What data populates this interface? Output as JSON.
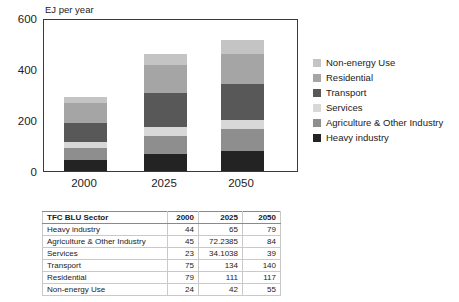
{
  "chart_data": {
    "type": "bar",
    "stacked": true,
    "ylabel": "EJ per year",
    "categories": [
      "2000",
      "2025",
      "2050"
    ],
    "series": [
      {
        "name": "Heavy industry",
        "color": "#232323",
        "values": [
          44,
          65,
          79
        ]
      },
      {
        "name": "Agriculture & Other Industry",
        "color": "#8e8e8e",
        "values": [
          45,
          72.2385,
          84
        ]
      },
      {
        "name": "Services",
        "color": "#d8d8d8",
        "values": [
          23,
          34.1038,
          39
        ]
      },
      {
        "name": "Transport",
        "color": "#585858",
        "values": [
          75,
          134,
          140
        ]
      },
      {
        "name": "Residential",
        "color": "#a5a5a5",
        "values": [
          79,
          111,
          117
        ]
      },
      {
        "name": "Non-energy Use",
        "color": "#c4c4c4",
        "values": [
          24,
          42,
          55
        ]
      }
    ],
    "legend_order": [
      "Non-energy Use",
      "Residential",
      "Transport",
      "Services",
      "Agriculture & Other Industry",
      "Heavy industry"
    ],
    "legend_position": "right",
    "ylim": [
      0,
      600
    ],
    "yticks": [
      0,
      200,
      400,
      600
    ],
    "grid": false
  },
  "table": {
    "headers": [
      "TFC BLU Sector",
      "2000",
      "2025",
      "2050"
    ],
    "rows": [
      [
        "Heavy industry",
        "44",
        "65",
        "79"
      ],
      [
        "Agriculture & Other Industry",
        "45",
        "72.2385",
        "84"
      ],
      [
        "Services",
        "23",
        "34.1038",
        "39"
      ],
      [
        "Transport",
        "75",
        "134",
        "140"
      ],
      [
        "Residential",
        "79",
        "111",
        "117"
      ],
      [
        "Non-energy Use",
        "24",
        "42",
        "55"
      ]
    ]
  }
}
